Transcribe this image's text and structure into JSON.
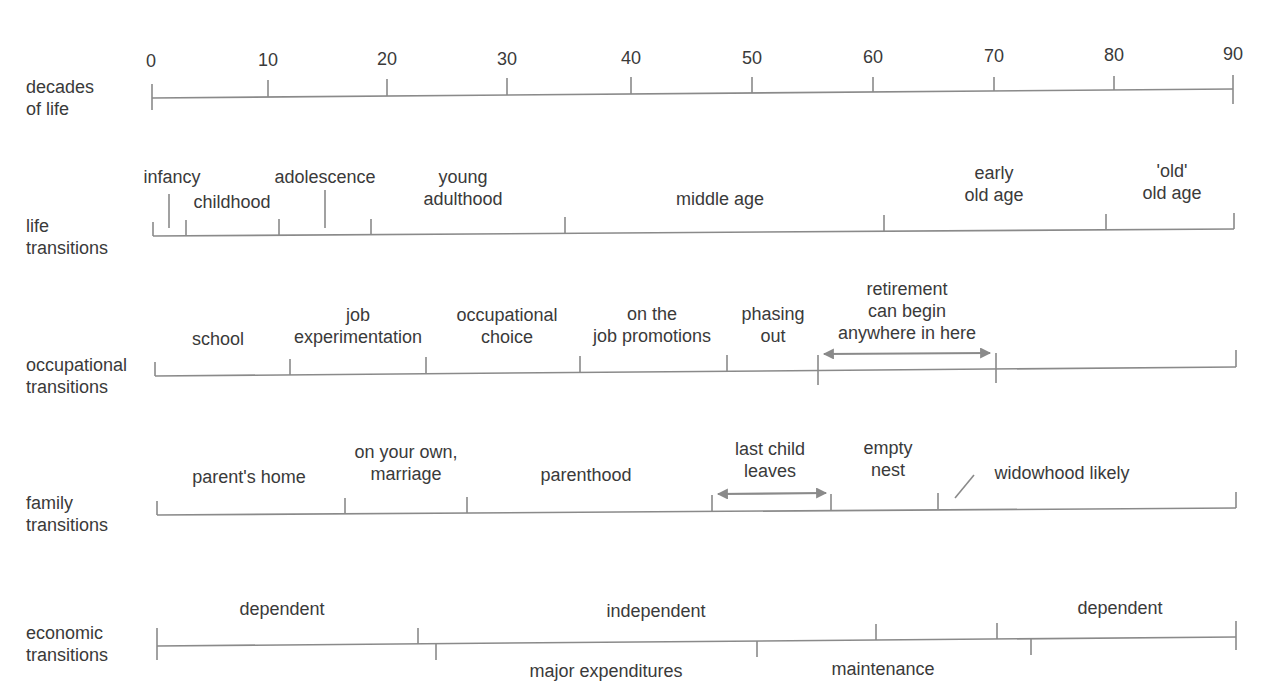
{
  "diagram": {
    "colors": {
      "text": "#3a3a3a",
      "line": "#8a8a8a",
      "arrow": "#8a8a8a",
      "background": "#ffffff"
    },
    "rows": [
      {
        "id": "decades",
        "label_lines": [
          "decades",
          "of life"
        ],
        "ticks": [
          "0",
          "10",
          "20",
          "30",
          "40",
          "50",
          "60",
          "70",
          "80",
          "90"
        ]
      },
      {
        "id": "life",
        "label_lines": [
          "life",
          "transitions"
        ],
        "segments": [
          {
            "lines": [
              "infancy"
            ]
          },
          {
            "lines": [
              "childhood"
            ]
          },
          {
            "lines": [
              "adolescence"
            ]
          },
          {
            "lines": [
              "young",
              "adulthood"
            ]
          },
          {
            "lines": [
              "middle age"
            ]
          },
          {
            "lines": [
              "early",
              "old age"
            ]
          },
          {
            "lines": [
              "'old'",
              "old age"
            ]
          }
        ]
      },
      {
        "id": "occupational",
        "label_lines": [
          "occupational",
          "transitions"
        ],
        "segments": [
          {
            "lines": [
              "school"
            ]
          },
          {
            "lines": [
              "job",
              "experimentation"
            ]
          },
          {
            "lines": [
              "occupational",
              "choice"
            ]
          },
          {
            "lines": [
              "on the",
              "job promotions"
            ]
          },
          {
            "lines": [
              "phasing",
              "out"
            ]
          },
          {
            "lines": [
              "retirement",
              "can begin",
              "anywhere in here"
            ],
            "arrow": "double"
          }
        ]
      },
      {
        "id": "family",
        "label_lines": [
          "family",
          "transitions"
        ],
        "segments": [
          {
            "lines": [
              "parent's home"
            ]
          },
          {
            "lines": [
              "on your own,",
              "marriage"
            ]
          },
          {
            "lines": [
              "parenthood"
            ]
          },
          {
            "lines": [
              "last child",
              "leaves"
            ],
            "arrow": "double"
          },
          {
            "lines": [
              "empty",
              "nest"
            ]
          },
          {
            "lines": [
              "widowhood likely"
            ],
            "leader_line": true
          }
        ]
      },
      {
        "id": "economic",
        "label_lines": [
          "economic",
          "transitions"
        ],
        "upper_segments": [
          {
            "lines": [
              "dependent"
            ]
          },
          {
            "lines": [
              "independent"
            ]
          },
          {
            "lines": [
              "dependent"
            ]
          }
        ],
        "lower_segments": [
          {
            "lines": [
              "major expenditures"
            ]
          },
          {
            "lines": [
              "maintenance"
            ]
          }
        ]
      }
    ]
  }
}
